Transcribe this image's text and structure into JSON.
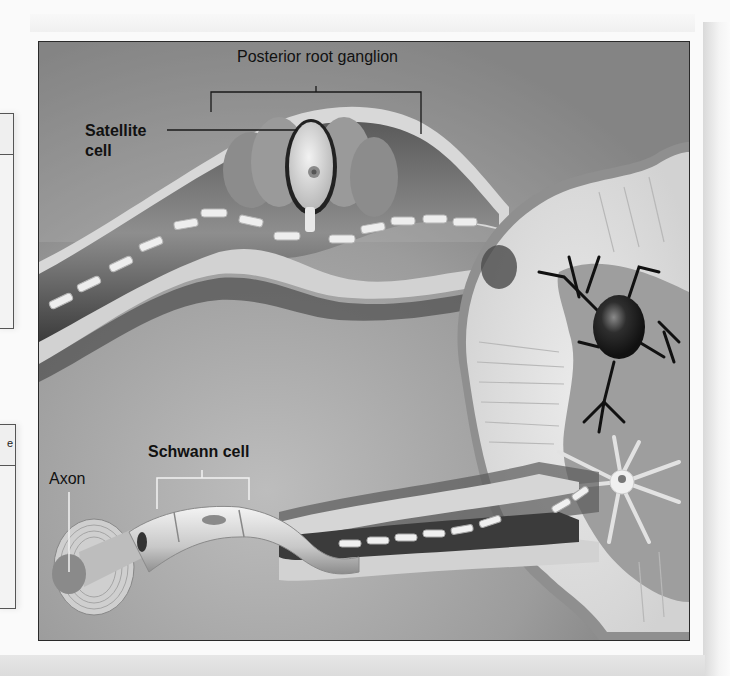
{
  "figure": {
    "labels": {
      "posterior_root_ganglion": "Posterior root ganglion",
      "satellite_cell_line1": "Satellite",
      "satellite_cell_line2": "cell",
      "schwann_cell": "Schwann cell",
      "axon": "Axon"
    },
    "colors": {
      "background_gray": "#a9a9a9",
      "spinal_cord_white_matter": "#e4e4e4",
      "gray_matter": "#9a9a9a",
      "neuron_dark": "#1e1e1e",
      "frame_border": "#2a2a2a"
    }
  },
  "side_boxes": [
    {
      "position": "top",
      "header_text": ""
    },
    {
      "position": "bottom",
      "header_text": "e"
    }
  ]
}
